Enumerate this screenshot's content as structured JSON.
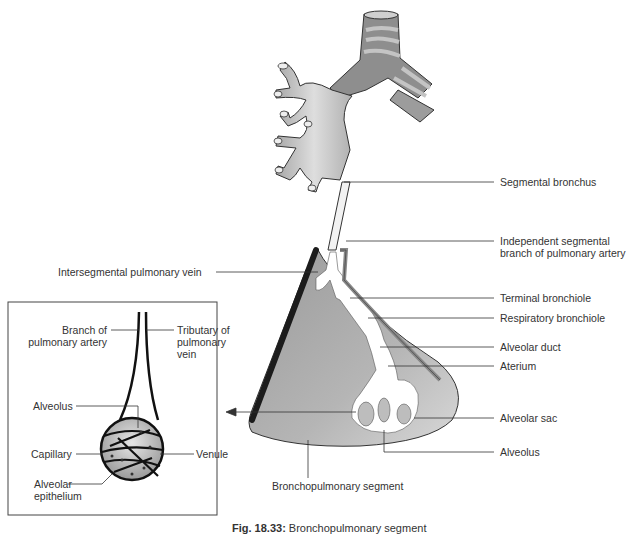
{
  "figure": {
    "caption_number": "Fig. 18.33:",
    "caption_text": "Bronchopulmonary segment",
    "colors": {
      "bronchus_light": "#c8c8c8",
      "bronchus_dark": "#8a8a8a",
      "segment_fill": "#b8b8b8",
      "vein": "#222222",
      "line": "#333333"
    }
  },
  "labels": {
    "right": [
      {
        "id": "segmental-bronchus",
        "text": "Segmental bronchus"
      },
      {
        "id": "independent-segmental-branch",
        "text": "Independent segmental\nbranch of pulmonary artery"
      },
      {
        "id": "terminal-bronchiole",
        "text": "Terminal bronchiole"
      },
      {
        "id": "respiratory-bronchiole",
        "text": "Respiratory bronchiole"
      },
      {
        "id": "alveolar-duct",
        "text": "Alveolar duct"
      },
      {
        "id": "aterium",
        "text": "Aterium"
      },
      {
        "id": "alveolar-sac",
        "text": "Alveolar sac"
      },
      {
        "id": "alveolus",
        "text": "Alveolus"
      }
    ],
    "left": [
      {
        "id": "intersegmental-pulmonary-vein",
        "text": "Intersegmental pulmonary vein"
      }
    ],
    "bottom": [
      {
        "id": "bronchopulmonary-segment",
        "text": "Bronchopulmonary segment"
      }
    ],
    "inset": [
      {
        "id": "branch-of-pulmonary-artery",
        "text": "Branch of\npulmonary artery"
      },
      {
        "id": "tributary-of-pulmonary-vein",
        "text": "Tributary of\npulmonary\nvein"
      },
      {
        "id": "inset-alveolus",
        "text": "Alveolus"
      },
      {
        "id": "capillary",
        "text": "Capillary"
      },
      {
        "id": "venule",
        "text": "Venule"
      },
      {
        "id": "alveolar-epithelium",
        "text": "Alveolar\nepithelium"
      }
    ]
  }
}
